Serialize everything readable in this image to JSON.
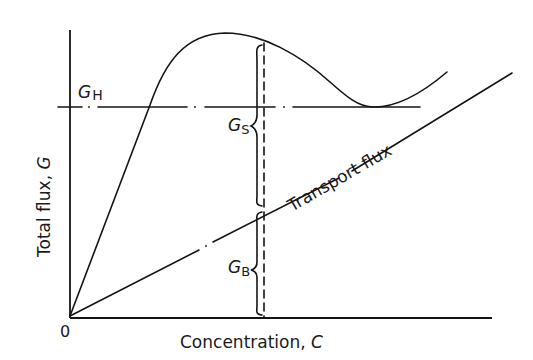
{
  "diagram": {
    "type": "flux-concentration plot",
    "axes": {
      "x_label_text": "Concentration, ",
      "x_label_symbol": "C",
      "y_label_text": "Total flux, ",
      "y_label_symbol": "G",
      "origin_label": "0"
    },
    "curves": [
      {
        "name": "total flux curve",
        "style": "solid"
      },
      {
        "name": "transport flux line",
        "style": "solid with dash-dot breaks",
        "label": "Transport flux"
      },
      {
        "name": "GH limiting flux line",
        "style": "dash-dot",
        "label_base": "G",
        "label_sub": "H"
      },
      {
        "name": "vertical operating line",
        "style": "dashed"
      }
    ],
    "braces": [
      {
        "name": "settling flux",
        "label_base": "G",
        "label_sub": "S"
      },
      {
        "name": "bulk flux",
        "label_base": "G",
        "label_sub": "B"
      }
    ],
    "colors": {
      "ink": "#141414",
      "background": "#ffffff"
    }
  }
}
